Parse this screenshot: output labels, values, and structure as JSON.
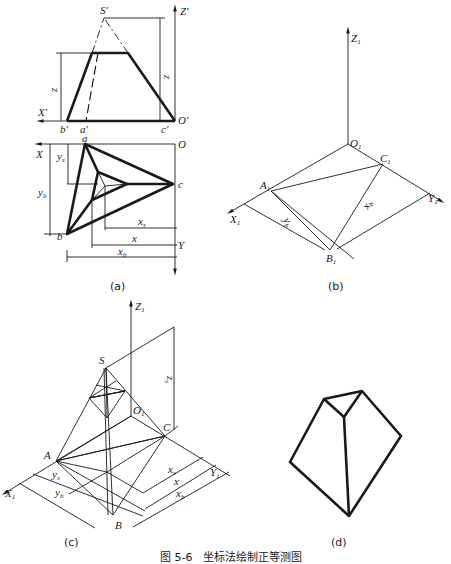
{
  "figure": {
    "caption": "图 5-6　坐标法绘制正等测图",
    "subfigures": [
      {
        "id": "a",
        "label": "(a)",
        "description": "Orthographic front and top views of truncated triangular pyramid"
      },
      {
        "id": "b",
        "label": "(b)",
        "description": "Isometric base triangle construction"
      },
      {
        "id": "c",
        "label": "(c)",
        "description": "Isometric construction with apex S"
      },
      {
        "id": "d",
        "label": "(d)",
        "description": "Final isometric drawing"
      }
    ]
  },
  "view_a": {
    "front": {
      "axes": {
        "z": "Z′",
        "x": "X′",
        "origin": "O′"
      },
      "points": {
        "apex": "S′",
        "a": "a′",
        "b": "b′",
        "c": "c′"
      },
      "dims": {
        "zs": "z",
        "zs_sub": "s",
        "z": "z"
      }
    },
    "top": {
      "axes": {
        "x": "X",
        "y": "Y",
        "origin": "O"
      },
      "points": {
        "a": "a",
        "b": "b",
        "c": "c",
        "s": "s"
      },
      "dims": {
        "ys": "y",
        "ys_sub": "s",
        "yb": "y",
        "yb_sub": "b",
        "xs": "x",
        "xs_sub": "s",
        "x": "x",
        "xb": "x",
        "xb_sub": "b"
      }
    },
    "label": "(a)"
  },
  "view_b": {
    "axes": {
      "z": "Z",
      "x": "X",
      "y": "Y",
      "sub": "1",
      "origin": "O"
    },
    "points": {
      "a": "A",
      "b": "B",
      "c": "C",
      "sub": "1"
    },
    "dims": {
      "yb": "y",
      "yb_sub": "b",
      "xb": "x",
      "xb_sub": "b"
    },
    "label": "(b)"
  },
  "view_c": {
    "axes": {
      "z": "Z",
      "x": "X",
      "origin": "O",
      "y": "Y",
      "sub": "1"
    },
    "points": {
      "s": "S",
      "a": "A",
      "b": "B",
      "c": "C"
    },
    "dims": {
      "zs": "z",
      "zs_sub": "s",
      "ys": "y",
      "ys_sub": "s",
      "yb": "y",
      "yb_sub": "b",
      "xs": "x",
      "xs_sub": "s",
      "x": "x",
      "xb": "x",
      "xb_sub": "b"
    },
    "label": "(c)"
  },
  "view_d": {
    "label": "(d)"
  }
}
